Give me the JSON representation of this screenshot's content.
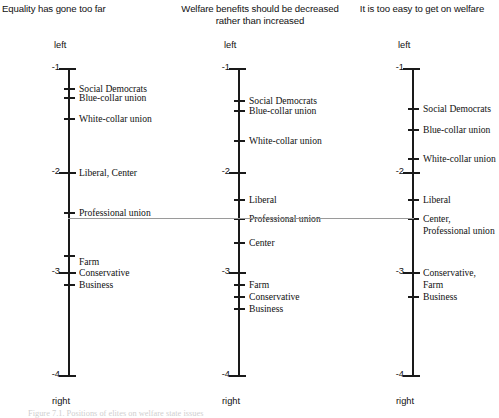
{
  "figure": {
    "pole_top_label": "left",
    "pole_bottom_label": "right",
    "caption_fragment": "Figure 7.1. Positions of elites on welfare state issues"
  },
  "chart_data": {
    "type": "scatter",
    "orientation": "vertical-axis-per-panel",
    "ylabel": "",
    "xlabel": "",
    "ylim": [
      -4,
      -1
    ],
    "yticks": [
      -1,
      -2,
      -3,
      -4
    ],
    "ytick_labels": [
      "-1",
      "-2",
      "-3",
      "-4"
    ],
    "grid": false,
    "legend": "none",
    "axis_pole_labels": {
      "top": "left",
      "bottom": "right"
    },
    "connector_note": "Grey horizontal reference line linking the 'Professional union' position across all three panels",
    "panels": [
      {
        "title": "Equality has gone too far",
        "points": [
          {
            "label": "Social Democrats",
            "value": -1.25
          },
          {
            "label": "Blue-collar union",
            "value": -1.34
          },
          {
            "label": "White-collar union",
            "value": -1.54
          },
          {
            "label": "Liberal, Center",
            "value": -2.0
          },
          {
            "label": "Professional union",
            "value": -2.39
          },
          {
            "label": "Farm",
            "value": -2.83
          },
          {
            "label": "Conservative",
            "value": -2.99
          },
          {
            "label": "Business",
            "value": -3.1
          }
        ]
      },
      {
        "title": "Welfare benefits should be decreased\nrather than increased",
        "points": [
          {
            "label": "Social Democrats",
            "value": -1.36
          },
          {
            "label": "Blue-collar union",
            "value": -1.46
          },
          {
            "label": "White-collar union",
            "value": -1.75
          },
          {
            "label": "Liberal",
            "value": -2.26
          },
          {
            "label": "Professional union",
            "value": -2.44
          },
          {
            "label": "Center",
            "value": -2.68
          },
          {
            "label": "Farm",
            "value": -3.1
          },
          {
            "label": "Conservative",
            "value": -3.22
          },
          {
            "label": "Business",
            "value": -3.33
          }
        ]
      },
      {
        "title": "It is too easy to get on welfare",
        "points": [
          {
            "label": "Social Democrats",
            "value": -1.44
          },
          {
            "label": "Blue-collar union",
            "value": -1.64
          },
          {
            "label": "White-collar union",
            "value": -1.92
          },
          {
            "label": "Liberal",
            "value": -2.31
          },
          {
            "label": "Center,\nProfessional union",
            "value": -2.44
          },
          {
            "label": "Conservative,\nFarm",
            "value": -3.0
          },
          {
            "label": "Business",
            "value": -3.22
          }
        ]
      }
    ]
  },
  "panels_render": [
    {
      "title": "Equality has gone too far",
      "axis_x": 68,
      "label_x": 79,
      "num_x": 40,
      "top_y": 68,
      "bottom_y": 375,
      "ticks": [
        {
          "type": "major",
          "y": 68,
          "num": "-1"
        },
        {
          "type": "major",
          "y": 172,
          "num": "-2"
        },
        {
          "type": "major",
          "y": 272,
          "num": "-3"
        },
        {
          "type": "major",
          "y": 375,
          "num": "-4"
        }
      ],
      "points": [
        {
          "y": 88,
          "label": "Social Democrats",
          "label_y": 83
        },
        {
          "y": 97,
          "label": "Blue-collar union",
          "label_y": 92
        },
        {
          "y": 118,
          "label": "White-collar union",
          "label_y": 113
        },
        {
          "y": 172,
          "label": "Liberal, Center",
          "label_y": 167
        },
        {
          "y": 212,
          "label": "Professional union",
          "label_y": 207
        },
        {
          "y": 255,
          "label": "Farm",
          "label_y": 256
        },
        {
          "y": 272,
          "label": "Conservative",
          "label_y": 267
        },
        {
          "y": 284,
          "label": "Business",
          "label_y": 279
        }
      ]
    },
    {
      "title": "Welfare benefits should be decreased\nrather than increased",
      "axis_x": 238,
      "label_x": 249,
      "num_x": 210,
      "top_y": 68,
      "bottom_y": 375,
      "ticks": [
        {
          "type": "major",
          "y": 68,
          "num": "-1"
        },
        {
          "type": "major",
          "y": 172,
          "num": "-2"
        },
        {
          "type": "major",
          "y": 272,
          "num": "-3"
        },
        {
          "type": "major",
          "y": 375,
          "num": "-4"
        }
      ],
      "points": [
        {
          "y": 100,
          "label": "Social Democrats",
          "label_y": 95
        },
        {
          "y": 110,
          "label": "Blue-collar union",
          "label_y": 105
        },
        {
          "y": 140,
          "label": "White-collar union",
          "label_y": 135
        },
        {
          "y": 199,
          "label": "Liberal",
          "label_y": 194
        },
        {
          "y": 218,
          "label": "Professional union",
          "label_y": 213
        },
        {
          "y": 242,
          "label": "Center",
          "label_y": 237
        },
        {
          "y": 284,
          "label": "Farm",
          "label_y": 279
        },
        {
          "y": 296,
          "label": "Conservative",
          "label_y": 291
        },
        {
          "y": 308,
          "label": "Business",
          "label_y": 303
        }
      ]
    },
    {
      "title": "It is too easy to get on welfare",
      "axis_x": 412,
      "label_x": 423,
      "num_x": 384,
      "top_y": 68,
      "bottom_y": 375,
      "ticks": [
        {
          "type": "major",
          "y": 68,
          "num": "-1"
        },
        {
          "type": "major",
          "y": 172,
          "num": "-2"
        },
        {
          "type": "major",
          "y": 272,
          "num": "-3"
        },
        {
          "type": "major",
          "y": 375,
          "num": "-4"
        }
      ],
      "points": [
        {
          "y": 108,
          "label": "Social Democrats",
          "label_y": 103
        },
        {
          "y": 129,
          "label": "Blue-collar union",
          "label_y": 124
        },
        {
          "y": 158,
          "label": "White-collar union",
          "label_y": 153
        },
        {
          "y": 199,
          "label": "Liberal",
          "label_y": 194
        },
        {
          "y": 218,
          "label": "Center,\nProfessional union",
          "label_y": 213
        },
        {
          "y": 272,
          "label": "Conservative,\nFarm",
          "label_y": 267
        },
        {
          "y": 296,
          "label": "Business",
          "label_y": 291
        }
      ]
    }
  ]
}
